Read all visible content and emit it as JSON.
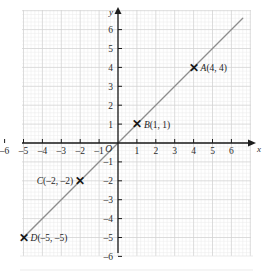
{
  "figure": {
    "type": "coordinate-plane",
    "axis_x_label": "x",
    "axis_y_label": "y",
    "origin_label": "O"
  },
  "chart_data": {
    "type": "line",
    "title": "",
    "subtitle": "",
    "xlabel": "x",
    "ylabel": "y",
    "xlim": [
      -6.6,
      6.6
    ],
    "ylim": [
      -6.4,
      6.6
    ],
    "xticks": [
      -6,
      -5,
      -4,
      -3,
      -2,
      -1,
      1,
      2,
      3,
      4,
      5,
      6
    ],
    "yticks": [
      6,
      5,
      4,
      3,
      2,
      1,
      -1,
      -2,
      -3,
      -4,
      -5,
      -6
    ],
    "xtick_labels": [
      "–6",
      "–5",
      "–4",
      "–3",
      "–2",
      "–1",
      "1",
      "2",
      "3",
      "4",
      "5",
      "6"
    ],
    "ytick_labels": [
      "6",
      "5",
      "4",
      "3",
      "2",
      "1",
      "–1",
      "–2",
      "–3",
      "–4",
      "–5",
      "–6"
    ],
    "grid": true,
    "minor_grid": true,
    "minor_divisions": 5,
    "legend": "none",
    "series": [
      {
        "name": "y = x",
        "equation": "y = x",
        "style": "solid",
        "x": [
          -6.6,
          6.6
        ],
        "values": [
          -6.6,
          6.6
        ],
        "color": "#8d8d8d"
      }
    ],
    "points": [
      {
        "id": "A",
        "label": "A(4, 4)",
        "name": "A",
        "coords": "(4, 4)",
        "x": 4,
        "y": 4,
        "marker": "x-cross",
        "label_side": "right"
      },
      {
        "id": "B",
        "label": "B(1, 1)",
        "name": "B",
        "coords": "(1, 1)",
        "x": 1,
        "y": 1,
        "marker": "x-cross",
        "label_side": "right"
      },
      {
        "id": "C",
        "label": "C(–2, –2)",
        "name": "C",
        "coords": "(–2, –2)",
        "x": -2,
        "y": -2,
        "marker": "x-cross",
        "label_side": "left"
      },
      {
        "id": "D",
        "label": "D(–5, –5)",
        "name": "D",
        "coords": "(–5, –5)",
        "x": -5,
        "y": -5,
        "marker": "x-cross",
        "label_side": "right"
      }
    ]
  },
  "colors": {
    "grid_major": "#d2d2d2",
    "grid_minor": "#ebebeb",
    "axis": "#1d1d1d",
    "line": "#8d8d8d",
    "text": "#1d1d1d",
    "background": "#ffffff"
  },
  "markers": {
    "glyph": "✕"
  }
}
